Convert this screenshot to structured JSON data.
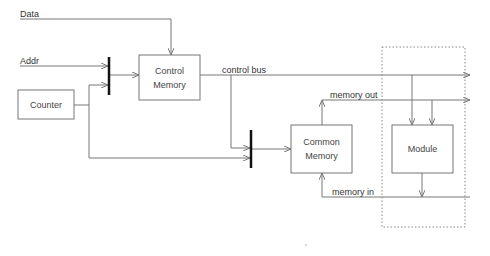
{
  "diagram": {
    "inputs": {
      "data": "Data",
      "addr": "Addr"
    },
    "blocks": {
      "counter": "Counter",
      "control_memory": [
        "Control",
        "Memory"
      ],
      "common_memory": [
        "Common",
        "Memory"
      ],
      "module": "Module"
    },
    "buses": {
      "control_bus": "control bus",
      "memory_out": "memory out",
      "memory_in": "memory in"
    },
    "colors": {
      "line": "#777777",
      "mux": "#111111",
      "dotted": "#888888"
    }
  }
}
